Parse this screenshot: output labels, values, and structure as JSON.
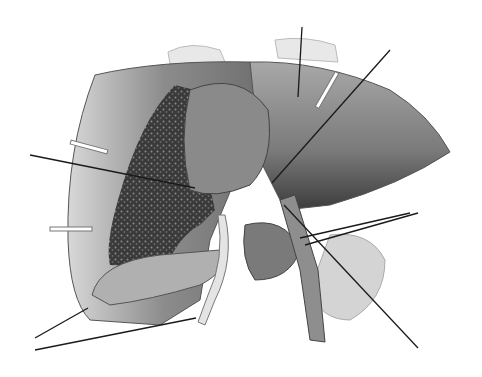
{
  "diagram": {
    "style": "grayscale",
    "labels": [
      {
        "id": "label-1",
        "text": ""
      },
      {
        "id": "label-2",
        "text": ""
      },
      {
        "id": "label-3",
        "text": ""
      },
      {
        "id": "label-4",
        "text": ""
      },
      {
        "id": "label-5",
        "text": ""
      },
      {
        "id": "label-6",
        "text": ""
      },
      {
        "id": "label-7",
        "text": ""
      },
      {
        "id": "label-8",
        "text": ""
      }
    ],
    "colors": {
      "background": "#ffffff",
      "liver_light": "#9a9a9a",
      "liver_dark": "#4a4a4a",
      "cut_surface": "#3a3a3a",
      "leader_line": "#1a1a1a"
    }
  }
}
